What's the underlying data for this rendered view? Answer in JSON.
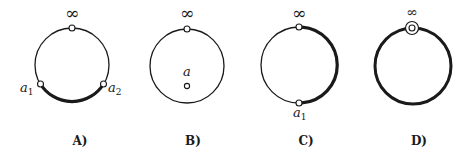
{
  "figure": {
    "panels": [
      {
        "id": "A",
        "caption": "A)",
        "infinity_label": "∞",
        "points": [
          {
            "name": "a",
            "sub": "1"
          },
          {
            "name": "a",
            "sub": "2"
          }
        ],
        "description": "Circle with point at infinity on top; bold arc on the bottom between a1 and a2"
      },
      {
        "id": "B",
        "caption": "B)",
        "infinity_label": "∞",
        "points": [
          {
            "name": "a",
            "sub": ""
          }
        ],
        "description": "Circle with point at infinity on top; interior point a"
      },
      {
        "id": "C",
        "caption": "C)",
        "infinity_label": "∞",
        "points": [
          {
            "name": "a",
            "sub": "1"
          }
        ],
        "description": "Circle with point at infinity on top and a1 at bottom; right half bold"
      },
      {
        "id": "D",
        "caption": "D)",
        "infinity_label": "∞",
        "points": [],
        "description": "Entire circle bold; point at infinity shown with a double ring"
      }
    ],
    "colors": {
      "stroke": "#1a1a1a",
      "background": "#ffffff"
    }
  }
}
